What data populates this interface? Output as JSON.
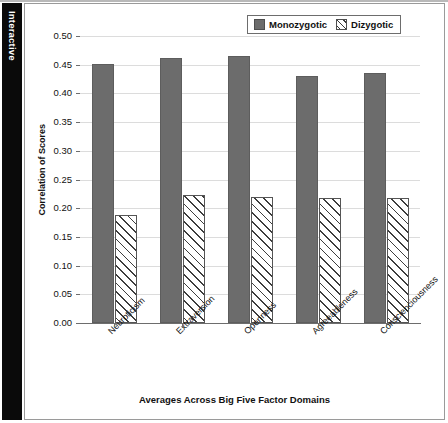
{
  "side_tab": {
    "label": "Interactive"
  },
  "chart_data": {
    "type": "bar",
    "title": "",
    "xlabel": "Averages Across Big Five Factor Domains",
    "ylabel": "Correlation of Scores",
    "categories": [
      "Neuroticism",
      "Extraversion",
      "Openness",
      "Agreeableness",
      "Conscienciousness"
    ],
    "series": [
      {
        "name": "Monozygotic",
        "values": [
          0.451,
          0.461,
          0.466,
          0.431,
          0.436
        ],
        "color": "#6c6c6c",
        "fill": "solid"
      },
      {
        "name": "Dizygotic",
        "values": [
          0.189,
          0.223,
          0.219,
          0.218,
          0.217
        ],
        "color": "#ffffff",
        "fill": "hatch"
      }
    ],
    "ylim": [
      0.0,
      0.5
    ],
    "ytick_values": [
      0.0,
      0.05,
      0.1,
      0.15,
      0.2,
      0.25,
      0.3,
      0.35,
      0.4,
      0.45,
      0.5
    ],
    "ytick_labels": [
      "0.00",
      "0.05",
      "0.10",
      "0.15",
      "0.20",
      "0.25",
      "0.30",
      "0.35",
      "0.40",
      "0.45",
      "0.50"
    ],
    "grid": true,
    "legend_position": "top-right",
    "legend_entries": [
      "Monozygotic",
      "Dizygotic"
    ]
  }
}
